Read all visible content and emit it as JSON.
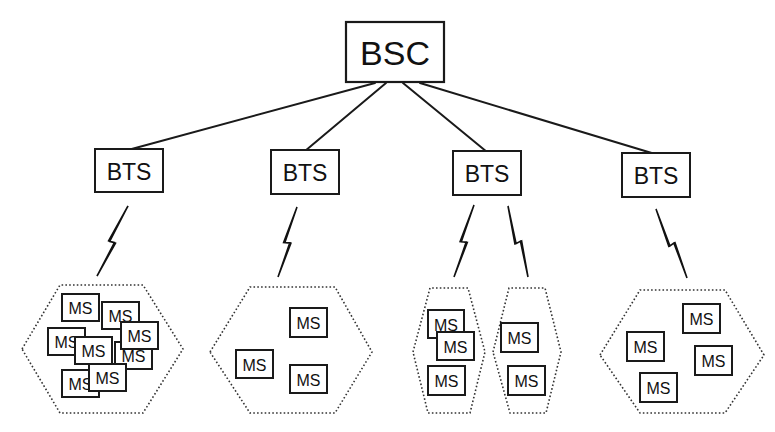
{
  "diagram": {
    "bsc": {
      "label": "BSC",
      "x": 346,
      "y": 22,
      "w": 98,
      "h": 60
    },
    "bts": [
      {
        "label": "BTS",
        "x": 95,
        "y": 149,
        "w": 68,
        "h": 43
      },
      {
        "label": "BTS",
        "x": 271,
        "y": 150,
        "w": 68,
        "h": 44
      },
      {
        "label": "BTS",
        "x": 453,
        "y": 151,
        "w": 68,
        "h": 44
      },
      {
        "label": "BTS",
        "x": 622,
        "y": 153,
        "w": 68,
        "h": 44
      }
    ],
    "links": [
      {
        "from": "BSC",
        "to": "BTS-1",
        "x1": 375,
        "y1": 83,
        "x2": 128,
        "y2": 150
      },
      {
        "from": "BSC",
        "to": "BTS-2",
        "x1": 386,
        "y1": 83,
        "x2": 305,
        "y2": 151
      },
      {
        "from": "BSC",
        "to": "BTS-3",
        "x1": 403,
        "y1": 83,
        "x2": 487,
        "y2": 152
      },
      {
        "from": "BSC",
        "to": "BTS-4",
        "x1": 420,
        "y1": 83,
        "x2": 655,
        "y2": 154
      }
    ],
    "radio_links": [
      {
        "x1": 128,
        "y1": 206,
        "x2": 97,
        "y2": 276
      },
      {
        "x1": 297,
        "y1": 207,
        "x2": 278,
        "y2": 277
      },
      {
        "x1": 474,
        "y1": 205,
        "x2": 454,
        "y2": 277
      },
      {
        "x1": 508,
        "y1": 206,
        "x2": 528,
        "y2": 277
      },
      {
        "x1": 656,
        "y1": 209,
        "x2": 687,
        "y2": 278
      }
    ],
    "cells": [
      {
        "points": "22,349 60,285 143,285 183,349 143,413 60,413"
      },
      {
        "points": "210,352 250,287 335,287 372,352 335,413 250,413"
      },
      {
        "points": "413,352 430,288 468,288 485,352 470,413 428,413"
      },
      {
        "points": "493,352 509,288 545,288 561,352 546,413 510,413"
      },
      {
        "points": "600,355 640,290 725,290 764,355 725,413 640,413"
      }
    ],
    "ms_label": "MS",
    "mobile_stations": [
      {
        "cell": 1,
        "x": 62,
        "y": 294,
        "w": 37,
        "h": 27
      },
      {
        "cell": 1,
        "x": 102,
        "y": 302,
        "w": 37,
        "h": 27
      },
      {
        "cell": 1,
        "x": 115,
        "y": 342,
        "w": 37,
        "h": 27
      },
      {
        "cell": 1,
        "x": 48,
        "y": 328,
        "w": 37,
        "h": 27
      },
      {
        "cell": 1,
        "x": 121,
        "y": 322,
        "w": 37,
        "h": 27
      },
      {
        "cell": 1,
        "x": 62,
        "y": 370,
        "w": 37,
        "h": 27
      },
      {
        "cell": 1,
        "x": 75,
        "y": 337,
        "w": 37,
        "h": 27
      },
      {
        "cell": 1,
        "x": 89,
        "y": 364,
        "w": 37,
        "h": 27
      },
      {
        "cell": 2,
        "x": 290,
        "y": 308,
        "w": 37,
        "h": 29
      },
      {
        "cell": 2,
        "x": 236,
        "y": 350,
        "w": 37,
        "h": 28
      },
      {
        "cell": 2,
        "x": 290,
        "y": 365,
        "w": 37,
        "h": 28
      },
      {
        "cell": 3,
        "x": 428,
        "y": 310,
        "w": 36,
        "h": 28
      },
      {
        "cell": 3,
        "x": 437,
        "y": 332,
        "w": 37,
        "h": 28
      },
      {
        "cell": 3,
        "x": 428,
        "y": 366,
        "w": 37,
        "h": 29
      },
      {
        "cell": 4,
        "x": 501,
        "y": 323,
        "w": 37,
        "h": 29
      },
      {
        "cell": 4,
        "x": 508,
        "y": 366,
        "w": 37,
        "h": 29
      },
      {
        "cell": 5,
        "x": 683,
        "y": 304,
        "w": 37,
        "h": 29
      },
      {
        "cell": 5,
        "x": 627,
        "y": 332,
        "w": 37,
        "h": 29
      },
      {
        "cell": 5,
        "x": 695,
        "y": 346,
        "w": 37,
        "h": 29
      },
      {
        "cell": 5,
        "x": 640,
        "y": 373,
        "w": 37,
        "h": 29
      }
    ]
  }
}
